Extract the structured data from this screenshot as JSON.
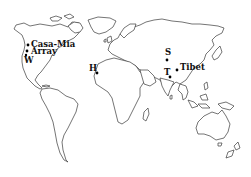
{
  "map": {
    "type": "world-outline",
    "background": "#ffffff",
    "outline_color": "#3a3a3a",
    "markers": [
      {
        "id": "casa-mia",
        "label": "Casa-Mia",
        "x": 28,
        "y": 45,
        "lx": 31,
        "ly": 47,
        "size": 8.5
      },
      {
        "id": "array",
        "label": "Array",
        "x": 27,
        "y": 51,
        "lx": 31,
        "ly": 54,
        "size": 8.5
      },
      {
        "id": "w",
        "label": "W",
        "x": 26,
        "y": 55,
        "lx": 24,
        "ly": 63,
        "size": 8.5
      },
      {
        "id": "h",
        "label": "H",
        "x": 97,
        "y": 73,
        "lx": 89,
        "ly": 71,
        "size": 8.5
      },
      {
        "id": "s",
        "label": "S",
        "x": 167,
        "y": 60,
        "lx": 165,
        "ly": 55,
        "size": 8.5
      },
      {
        "id": "t",
        "label": "T",
        "x": 170,
        "y": 77,
        "lx": 164,
        "ly": 75,
        "size": 8.5
      },
      {
        "id": "tibet",
        "label": "Tibet",
        "x": 177,
        "y": 70,
        "lx": 180,
        "ly": 70,
        "size": 8.5
      }
    ]
  }
}
